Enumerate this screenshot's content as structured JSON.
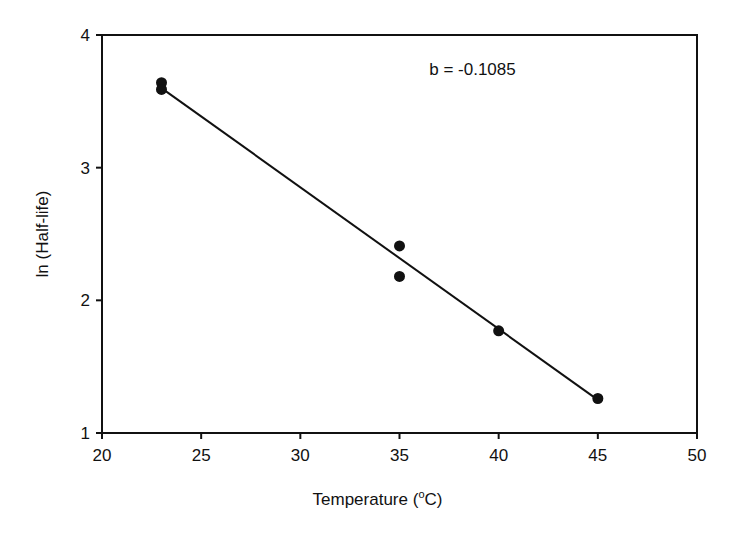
{
  "chart_data": {
    "type": "scatter",
    "title": "",
    "xlabel": "Temperature (°C)",
    "xlabel_parts": {
      "prefix": "Temperature (",
      "superscript": "o",
      "suffix": "C)"
    },
    "ylabel": "ln (Half-life)",
    "xlim": [
      20,
      50
    ],
    "ylim": [
      1,
      4
    ],
    "x_ticks": [
      20,
      25,
      30,
      35,
      40,
      45,
      50
    ],
    "y_ticks": [
      1,
      2,
      3,
      4
    ],
    "grid": false,
    "legend": null,
    "series": [
      {
        "name": "data",
        "marker": "filled-circle",
        "points": [
          {
            "x": 23,
            "y": 3.64
          },
          {
            "x": 23,
            "y": 3.59
          },
          {
            "x": 35,
            "y": 2.41
          },
          {
            "x": 35,
            "y": 2.18
          },
          {
            "x": 40,
            "y": 1.77
          },
          {
            "x": 45,
            "y": 1.26
          }
        ]
      },
      {
        "name": "regression line",
        "type": "line",
        "points": [
          {
            "x": 23,
            "y": 3.6
          },
          {
            "x": 45,
            "y": 1.25
          }
        ]
      }
    ],
    "annotations": [
      {
        "text": "b = -0.1085",
        "x": 36.5,
        "y": 3.7
      }
    ]
  }
}
